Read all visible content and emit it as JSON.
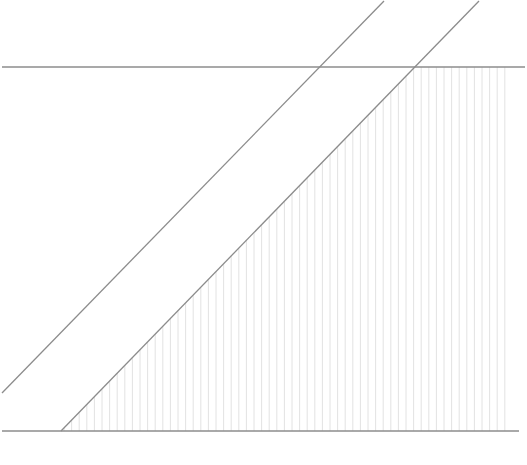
{
  "diagram": {
    "width": 527,
    "height": 465,
    "colors": {
      "background": "#ffffff",
      "line": "#8c8c8c",
      "hatch": "#dadada"
    },
    "top_horizontal": {
      "x1": 2,
      "y1": 67,
      "x2": 525,
      "y2": 67
    },
    "bottom_horizontal": {
      "x1": 2,
      "y1": 431,
      "x2": 519,
      "y2": 431
    },
    "diagonal_left": {
      "x1": 2,
      "y1": 393,
      "x2": 384,
      "y2": 1
    },
    "diagonal_right": {
      "x1": 61,
      "y1": 431,
      "x2": 479,
      "y2": 1
    },
    "hatch": {
      "x_start": 64,
      "x_end": 512,
      "spacing": 7.6,
      "top_y": 67,
      "bottom_y": 431
    }
  }
}
